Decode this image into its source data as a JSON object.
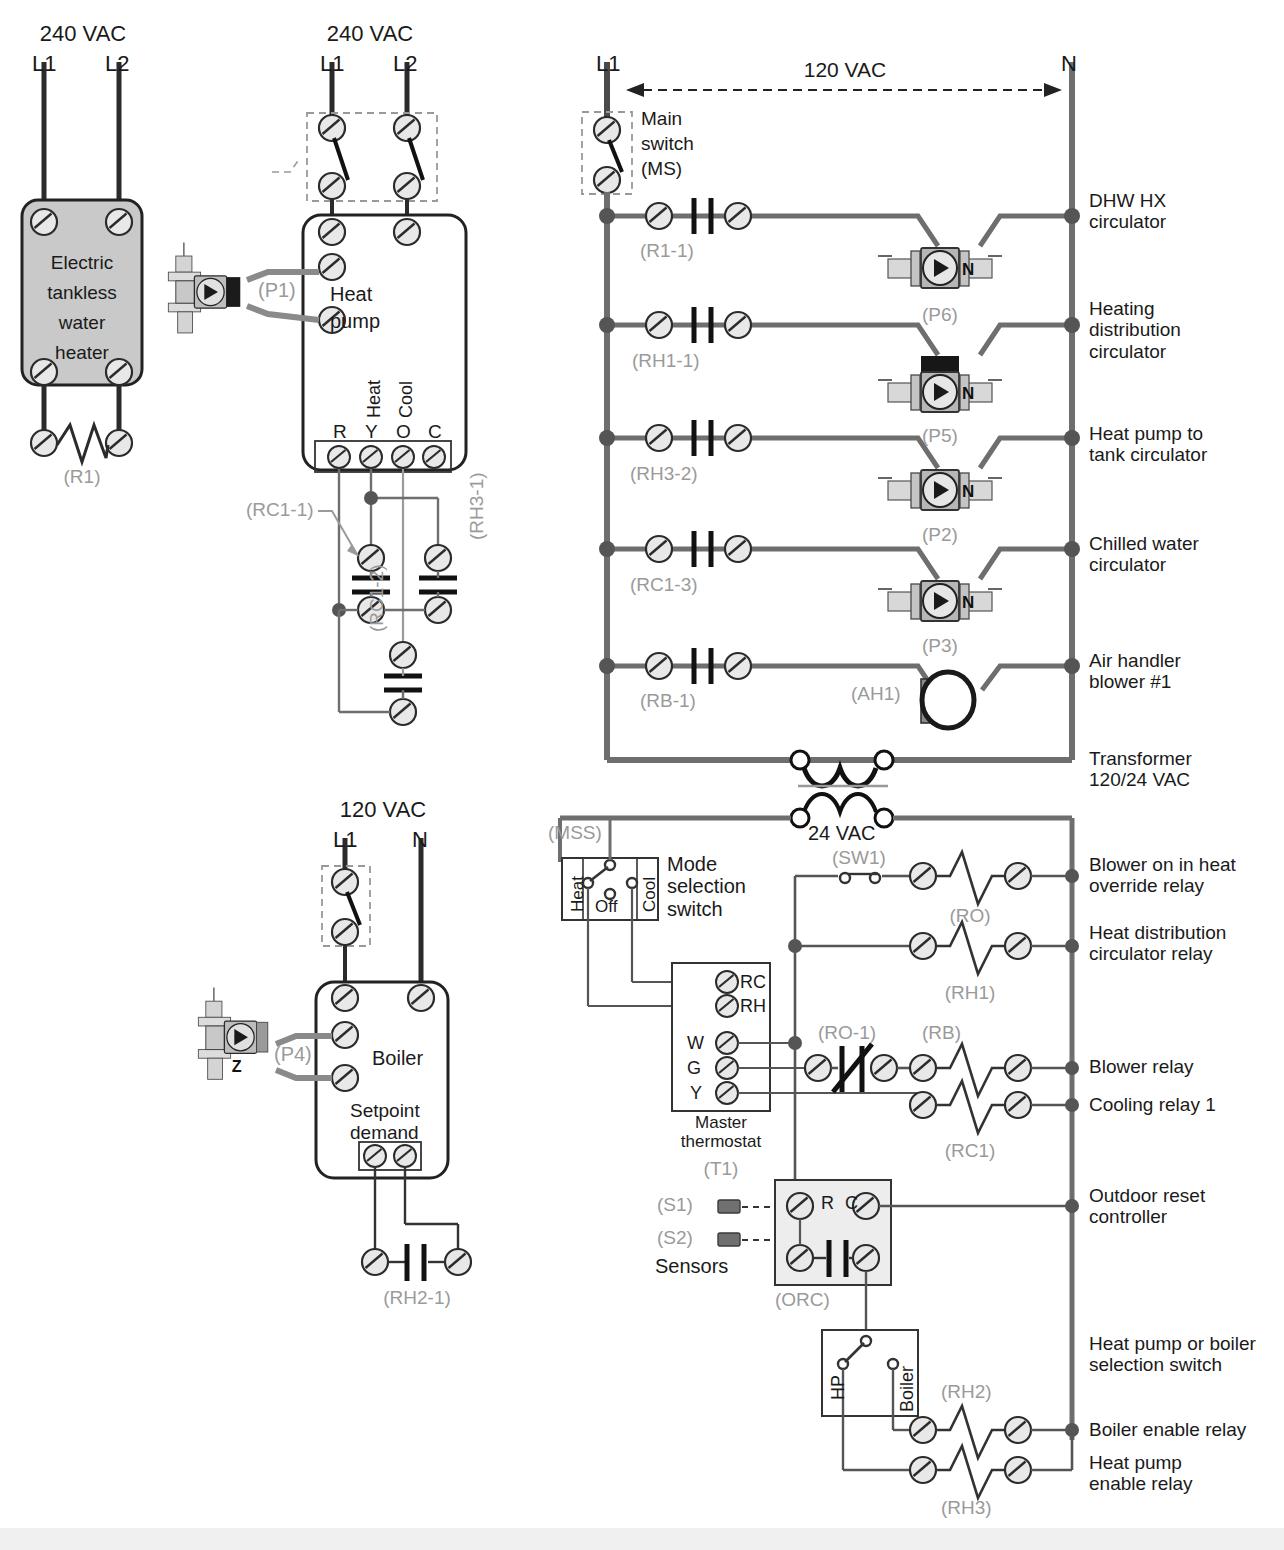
{
  "diagram": {
    "colors": {
      "wire_dark": "#3a3a3a",
      "wire_medium": "#6e6e6e",
      "wire_light": "#8a8a8a",
      "terminal_fill": "#e8e8e8",
      "box_gray_fill": "#c9c9c9",
      "box_light_fill": "#ededed",
      "label_gray": "#9a9a9a",
      "text": "#1a1a1a",
      "bottom_strip": "#f0f0f0"
    }
  },
  "water_heater_panel": {
    "supply_label": "240 VAC",
    "line1": "L1",
    "line2": "L2",
    "box_label_lines": [
      "Electric",
      "tankless",
      "water",
      "heater"
    ],
    "relay_tag": "(R1)"
  },
  "heat_pump_panel": {
    "supply_label": "240 VAC",
    "line1": "L1",
    "line2": "L2",
    "box_label_lines": [
      "Heat",
      "pump"
    ],
    "circulator_tag": "(P1)",
    "terminal_letters": [
      "R",
      "Y",
      "O",
      "C"
    ],
    "terminal_functions": [
      "Heat",
      "Cool"
    ],
    "contact_tags": [
      "(RC1-1)",
      "(RH3-1)",
      "(RC1-2)"
    ]
  },
  "boiler_panel": {
    "supply_label": "120 VAC",
    "line1": "L1",
    "neutral": "N",
    "box_label": "Boiler",
    "setpoint_lines": [
      "Setpoint",
      "demand"
    ],
    "circulator_tag": "(P4)",
    "contact_tag": "(RH2-1)"
  },
  "ladder_120": {
    "line_left": "L1",
    "line_right": "N",
    "voltage_label": "120 VAC",
    "main_switch_lines": [
      "Main",
      "switch",
      "(MS)"
    ],
    "rungs": [
      {
        "contact": "(R1-1)",
        "device": "(P6)",
        "description": "DHW HX\ncirculator",
        "device_type": "circulator"
      },
      {
        "contact": "(RH1-1)",
        "device": "(P5)",
        "description": "Heating\ndistribution\ncirculator",
        "device_type": "circulator"
      },
      {
        "contact": "(RH3-2)",
        "device": "(P2)",
        "description": "Heat pump to\ntank circulator",
        "device_type": "circulator"
      },
      {
        "contact": "(RC1-3)",
        "device": "(P3)",
        "description": "Chilled water\ncirculator",
        "device_type": "circulator"
      },
      {
        "contact": "(RB-1)",
        "device": "(AH1)",
        "description": "Air handler\nblower #1",
        "device_type": "blower"
      }
    ],
    "transformer_label": "Transformer\n120/24 VAC"
  },
  "ladder_24": {
    "secondary_label": "24 VAC",
    "mode_switch": {
      "tag": "(MSS)",
      "positions": [
        "Heat",
        "Off",
        "Cool"
      ],
      "caption": "Mode\nselection\nswitch"
    },
    "thermostat": {
      "terminals_top": [
        "RC",
        "RH"
      ],
      "terminals_left": [
        "W",
        "G",
        "Y"
      ],
      "caption": "Master\nthermostat",
      "tag": "(T1)"
    },
    "sw1_tag": "(SW1)",
    "ro1_tag": "(RO-1)",
    "rungs": [
      {
        "coil": "(RO)",
        "description": "Blower on in heat\noverride relay"
      },
      {
        "coil": "(RH1)",
        "description": "Heat distribution\ncirculator relay"
      },
      {
        "coil": "(RB)",
        "description": "Blower relay"
      },
      {
        "coil": "(RC1)",
        "description": "Cooling relay 1"
      }
    ],
    "orc": {
      "tag": "(ORC)",
      "terminals": [
        "R",
        "C"
      ],
      "sensors_label": "Sensors",
      "sensor_tags": [
        "(S1)",
        "(S2)"
      ],
      "description": "Outdoor reset\ncontroller"
    },
    "hp_boiler_switch": {
      "positions": [
        "HP",
        "Boiler"
      ],
      "description": "Heat pump or boiler\nselection switch"
    },
    "bottom_rungs": [
      {
        "coil": "(RH2)",
        "description": "Boiler enable relay"
      },
      {
        "coil": "(RH3)",
        "description": "Heat pump\nenable relay"
      }
    ]
  }
}
